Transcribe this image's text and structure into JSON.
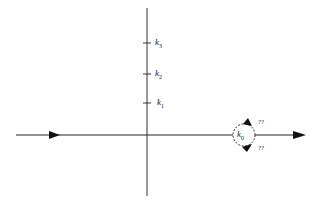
{
  "diagram": {
    "imaginary_axis_labels": [
      {
        "name": "k",
        "sub": "3"
      },
      {
        "name": "k",
        "sub": "2"
      },
      {
        "name": "k",
        "sub": "1"
      }
    ],
    "real_axis_point": {
      "name": "k",
      "sub": "0"
    },
    "indent_labels": [
      "??",
      "??"
    ],
    "colors": {
      "line": "#222222",
      "background": "#ffffff"
    }
  }
}
